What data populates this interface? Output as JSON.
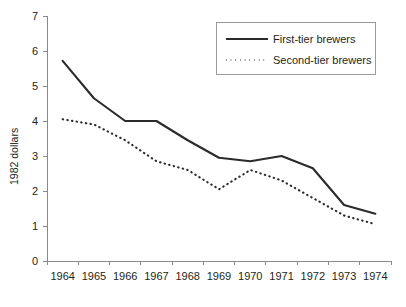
{
  "chart_data": {
    "type": "line",
    "title": "",
    "xlabel": "",
    "ylabel": "1982 dollars",
    "categories": [
      "1964",
      "1965",
      "1966",
      "1967",
      "1968",
      "1969",
      "1970",
      "1971",
      "1972",
      "1973",
      "1974"
    ],
    "ylim": [
      0,
      7
    ],
    "yticks": [
      0,
      1,
      2,
      3,
      4,
      5,
      6,
      7
    ],
    "ytick_labels": [
      "0",
      "1",
      "2",
      "3",
      "4",
      "5",
      "6",
      "7"
    ],
    "grid": false,
    "legend_position": "top-right",
    "series": [
      {
        "name": "First-tier brewers",
        "style": "solid",
        "color": "#2b2b2b",
        "values": [
          5.72,
          4.65,
          4.0,
          4.0,
          3.45,
          2.95,
          2.85,
          3.0,
          2.65,
          1.6,
          1.35
        ]
      },
      {
        "name": "Second-tier brewers",
        "style": "dotted",
        "color": "#2b2b2b",
        "values": [
          4.05,
          3.9,
          3.45,
          2.85,
          2.6,
          2.05,
          2.6,
          2.3,
          1.8,
          1.3,
          1.05
        ]
      }
    ]
  },
  "legend": {
    "entries": [
      {
        "label": "First-tier brewers",
        "style": "solid"
      },
      {
        "label": "Second-tier brewers",
        "style": "dotted"
      }
    ]
  },
  "axes": {
    "y_axis_title": "1982 dollars"
  }
}
